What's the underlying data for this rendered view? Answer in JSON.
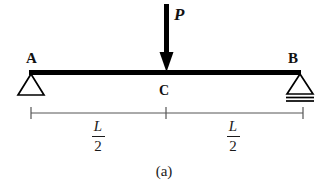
{
  "figure": {
    "caption": "(a)",
    "type": "simply-supported-beam-free-body-diagram"
  },
  "nodes": {
    "left_support_label": "A",
    "right_support_label": "B",
    "midpoint_label": "C"
  },
  "load": {
    "label": "P",
    "direction": "downward",
    "applied_at": "C"
  },
  "supports": {
    "left_type": "pin",
    "right_type": "roller"
  },
  "dimensions": {
    "left": {
      "numerator": "L",
      "denominator": "2"
    },
    "right": {
      "numerator": "L",
      "denominator": "2"
    }
  },
  "colors": {
    "beam": "#000000",
    "arrow": "#000000",
    "support": "#000000",
    "dimension": "#555555",
    "text": "#1a1a1a",
    "background": "#ffffff"
  }
}
